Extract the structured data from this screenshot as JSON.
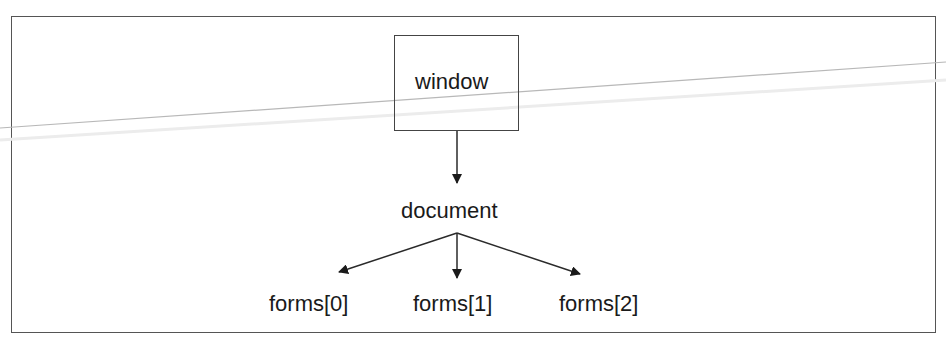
{
  "diagram": {
    "type": "tree",
    "nodes": {
      "root": {
        "id": "window",
        "label": "window",
        "boxed": true
      },
      "child": {
        "id": "document",
        "label": "document",
        "boxed": false
      },
      "leaves": [
        {
          "id": "forms0",
          "label": "forms[0]"
        },
        {
          "id": "forms1",
          "label": "forms[1]"
        },
        {
          "id": "forms2",
          "label": "forms[2]"
        }
      ]
    },
    "edges": [
      {
        "from": "window",
        "to": "document"
      },
      {
        "from": "document",
        "to": "forms[0]"
      },
      {
        "from": "document",
        "to": "forms[1]"
      },
      {
        "from": "document",
        "to": "forms[2]"
      }
    ],
    "colors": {
      "line": "#2a2a2a",
      "frame": "#555555",
      "artifact_line": "#b8b8b8"
    }
  }
}
